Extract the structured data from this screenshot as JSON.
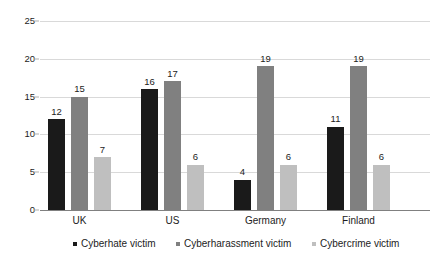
{
  "chart_data": {
    "type": "bar",
    "title": "",
    "subtitle": "",
    "xlabel": "",
    "ylabel": "",
    "categories": [
      "UK",
      "US",
      "Germany",
      "Finland"
    ],
    "series": [
      {
        "name": "Cyberhate victim",
        "color": "#1a1a1a",
        "values": [
          12,
          16,
          4,
          11
        ]
      },
      {
        "name": "Cyberharassment victim",
        "color": "#808080",
        "values": [
          15,
          17,
          19,
          19
        ]
      },
      {
        "name": "Cybercrime victim",
        "color": "#bfbfbf",
        "values": [
          7,
          6,
          6,
          6
        ]
      }
    ],
    "ylim": [
      0,
      25
    ],
    "yticks": [
      0,
      5,
      10,
      15,
      20,
      25
    ],
    "ytick_labels": [
      "0",
      "5",
      "10",
      "15",
      "20",
      "25"
    ],
    "grid": true,
    "grid_axis": "y",
    "legend_position": "bottom",
    "data_labels": true
  },
  "legend": {
    "items": [
      {
        "label": "Cyberhate victim",
        "color": "#1a1a1a"
      },
      {
        "label": "Cyberharassment victim",
        "color": "#808080"
      },
      {
        "label": "Cybercrime victim",
        "color": "#bfbfbf"
      }
    ]
  }
}
